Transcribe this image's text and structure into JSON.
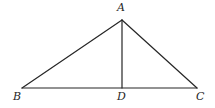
{
  "figure": {
    "kind": "geometry-diagram",
    "background_color": "#ffffff",
    "stroke_color": "#262626",
    "stroke_width": 1.2,
    "label_color": "#262626",
    "points": {
      "A": {
        "label": "A",
        "x": 122,
        "y": 20
      },
      "B": {
        "label": "B",
        "x": 22,
        "y": 88
      },
      "C": {
        "label": "C",
        "x": 197,
        "y": 88
      },
      "D": {
        "label": "D",
        "x": 122,
        "y": 88
      }
    },
    "segments": [
      {
        "name": "AB",
        "from": "A",
        "to": "B"
      },
      {
        "name": "AC",
        "from": "A",
        "to": "C"
      },
      {
        "name": "BC",
        "from": "B",
        "to": "C"
      },
      {
        "name": "AD",
        "from": "A",
        "to": "D"
      }
    ]
  }
}
